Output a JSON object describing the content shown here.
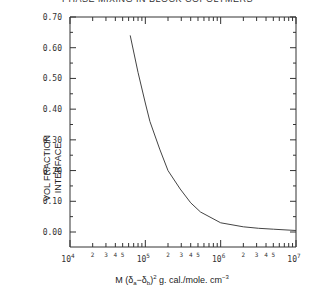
{
  "chart_data": {
    "type": "line",
    "title": "PHASE MIXING IN BLOCK COPOLYMERS",
    "xlabel": "M (δa−δb)² g. cal./mole. cm⁻³",
    "xlabel_parts": {
      "pre": "M (δ",
      "sub_a": "a",
      "mid": "−δ",
      "sub_b": "b",
      "post": ")",
      "sup": "2",
      "tail": " g. cal./mole. cm",
      "sup2": "−3"
    },
    "ylabel": [
      "VOL FRACTION",
      "INTERFACE"
    ],
    "xscale": "log",
    "xlim": [
      10000,
      10000000
    ],
    "ylim": [
      0.0,
      0.7
    ],
    "y_axis_bottom_extends_below_zero": true,
    "yticks": [
      "0.00",
      "0.10",
      "0.20",
      "0.30",
      "0.40",
      "0.50",
      "0.60",
      "0.70"
    ],
    "ytick_values": [
      0.0,
      0.1,
      0.2,
      0.3,
      0.4,
      0.5,
      0.6,
      0.7
    ],
    "xticks_major": [
      {
        "value": 10000,
        "base": "10",
        "exp": "4"
      },
      {
        "value": 100000,
        "base": "10",
        "exp": "5"
      },
      {
        "value": 1000000,
        "base": "10",
        "exp": "6"
      },
      {
        "value": 10000000,
        "base": "10",
        "exp": "7"
      }
    ],
    "xticks_minor_labels": [
      "2",
      "3",
      "4",
      "5"
    ],
    "grid": false,
    "legend": null,
    "series": [
      {
        "name": "interface volume fraction",
        "x": [
          63000,
          80000,
          100000,
          115000,
          155000,
          200000,
          290000,
          400000,
          540000,
          1000000,
          2000000,
          3200000,
          5000000,
          10000000
        ],
        "y": [
          0.64,
          0.52,
          0.42,
          0.36,
          0.27,
          0.2,
          0.14,
          0.095,
          0.065,
          0.03,
          0.017,
          0.012,
          0.009,
          0.005
        ]
      }
    ]
  }
}
